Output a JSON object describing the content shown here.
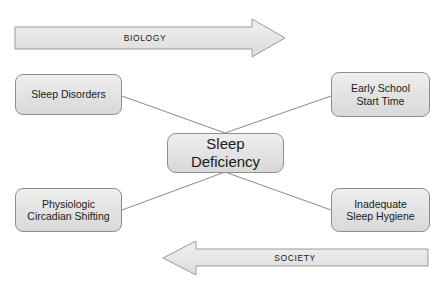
{
  "diagram": {
    "colors": {
      "box_fill_top": "#efefef",
      "box_fill_bottom": "#d9d9d9",
      "box_border": "#8e8e8e",
      "arrow_fill": "#e3e3e3",
      "arrow_border": "#9a9a9a",
      "line": "#8a8a8a",
      "text": "#1a1a1a",
      "background": "#ffffff"
    },
    "center": {
      "label": "Sleep\nDeficiency",
      "line1": "Sleep",
      "line2": "Deficiency"
    },
    "nodes": [
      {
        "id": "sleep-disorders",
        "label": "Sleep Disorders",
        "position": "top-left",
        "domain": "BIOLOGY"
      },
      {
        "id": "early-school-start-time",
        "label": "Early School\nStart Time",
        "position": "top-right",
        "domain": "BIOLOGY"
      },
      {
        "id": "physiologic-circadian-shifting",
        "label": "Physiologic\nCircadian Shifting",
        "position": "bottom-left",
        "domain": "SOCIETY"
      },
      {
        "id": "inadequate-sleep-hygiene",
        "label": "Inadequate\nSleep Hygiene",
        "position": "bottom-right",
        "domain": "SOCIETY"
      }
    ],
    "arrows": [
      {
        "id": "biology-arrow",
        "label": "BIOLOGY",
        "direction": "right",
        "position": "top"
      },
      {
        "id": "society-arrow",
        "label": "SOCIETY",
        "direction": "left",
        "position": "bottom"
      }
    ],
    "connectors": [
      {
        "from": "sleep-disorders",
        "to": "center"
      },
      {
        "from": "early-school-start-time",
        "to": "center"
      },
      {
        "from": "physiologic-circadian-shifting",
        "to": "center"
      },
      {
        "from": "inadequate-sleep-hygiene",
        "to": "center"
      }
    ]
  }
}
